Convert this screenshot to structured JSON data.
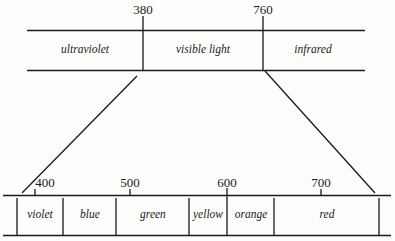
{
  "upper_band": {
    "ticks": [
      {
        "value": "380",
        "x": 143
      },
      {
        "value": "760",
        "x": 263
      }
    ],
    "regions": [
      {
        "label": "ultraviolet",
        "x": 85
      },
      {
        "label": "visible light",
        "x": 203
      },
      {
        "label": "infrared",
        "x": 313
      }
    ]
  },
  "lower_band": {
    "ticks": [
      {
        "value": "400",
        "x": 35
      },
      {
        "value": "500",
        "x": 130
      },
      {
        "value": "600",
        "x": 227
      },
      {
        "value": "700",
        "x": 321
      }
    ],
    "regions": [
      {
        "label": "violet",
        "x": 40
      },
      {
        "label": "blue",
        "x": 90
      },
      {
        "label": "green",
        "x": 153
      },
      {
        "label": "yellow",
        "x": 208
      },
      {
        "label": "orange",
        "x": 251
      },
      {
        "label": "red",
        "x": 327
      }
    ]
  },
  "colors": {
    "ink": "#1a1a1a",
    "background": "#fdfdfb"
  }
}
